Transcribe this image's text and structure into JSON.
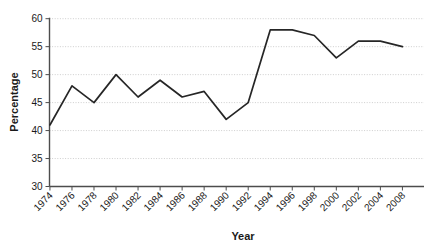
{
  "chart_data": {
    "type": "line",
    "title": "",
    "xlabel": "Year",
    "ylabel": "Percentage",
    "categories": [
      "1974",
      "1976",
      "1978",
      "1980",
      "1982",
      "1984",
      "1986",
      "1988",
      "1990",
      "1992",
      "1994",
      "1996",
      "1998",
      "2000",
      "2002",
      "2004",
      "2008"
    ],
    "values": [
      41,
      48,
      45,
      50,
      46,
      49,
      46,
      47,
      42,
      45,
      58,
      58,
      57,
      53,
      56,
      56,
      55
    ],
    "series": [
      {
        "name": "Percentage",
        "values": [
          41,
          48,
          45,
          50,
          46,
          49,
          46,
          47,
          42,
          45,
          58,
          58,
          57,
          53,
          56,
          56,
          55
        ]
      }
    ],
    "ylim": [
      30,
      60
    ],
    "yticks": [
      30,
      35,
      40,
      45,
      50,
      55,
      60
    ],
    "ytick_labels": [
      "30",
      "35",
      "40",
      "45",
      "50",
      "55",
      "60"
    ],
    "xtick_labels": [
      "1974",
      "1976",
      "1978",
      "1980",
      "1982",
      "1984",
      "1986",
      "1988",
      "1990",
      "1992",
      "1994",
      "1996",
      "1998",
      "2000",
      "2002",
      "2004",
      "2008"
    ],
    "grid": true,
    "grid_axis": "y",
    "legend": "none",
    "line_color": "#262626",
    "grid_color": "#b9b9b9",
    "axis_color": "#4d4d4d",
    "background_color": "#ffffff",
    "xtick_label_rotation": -45
  },
  "axes": {
    "y_title": "Percentage",
    "x_title": "Year"
  }
}
